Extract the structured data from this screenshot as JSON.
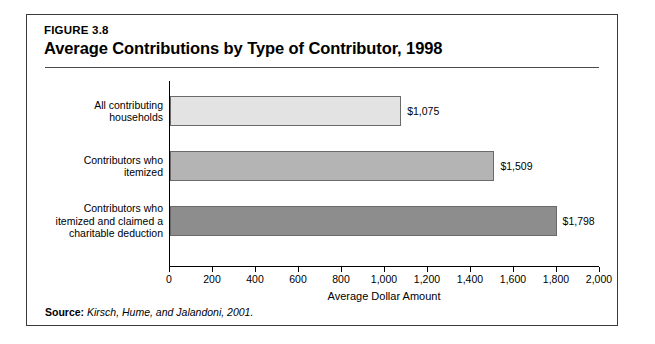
{
  "figure": {
    "number": "FIGURE 3.8",
    "title": "Average Contributions by Type of Contributor, 1998"
  },
  "source": {
    "label": "Source:",
    "text": "Kirsch, Hume, and Jalandoni, 2001."
  },
  "colors": {
    "bar_light": "#e3e3e3",
    "bar_medium": "#b4b4b4",
    "bar_dark": "#8d8d8d",
    "bar_border": "#6a6a6a",
    "axis": "#000000",
    "frame": "#3a3a3a"
  },
  "chart_data": {
    "type": "bar",
    "orientation": "horizontal",
    "title": "Average Contributions by Type of Contributor, 1998",
    "subtitle": "FIGURE 3.8",
    "xlabel": "Average Dollar Amount",
    "ylabel": "",
    "xlim": [
      0,
      2000
    ],
    "grid": false,
    "legend": "none",
    "xticks": [
      0,
      200,
      400,
      600,
      800,
      1000,
      1200,
      1400,
      1600,
      1800,
      2000
    ],
    "xtick_labels": [
      "0",
      "200",
      "400",
      "600",
      "800",
      "1,000",
      "1,200",
      "1,400",
      "1,600",
      "1,800",
      "2,000"
    ],
    "categories": [
      "All contributing households",
      "Contributors who itemized",
      "Contributors who itemized and claimed a charitable deduction"
    ],
    "values": [
      1075,
      1509,
      1798
    ],
    "data_labels": [
      "$1,075",
      "$1,509",
      "$1,798"
    ]
  },
  "bars": [
    {
      "label_lines": [
        "All contributing",
        "households"
      ],
      "value": 1075,
      "value_label": "$1,075",
      "color": "#e3e3e3"
    },
    {
      "label_lines": [
        "Contributors who",
        "itemized"
      ],
      "value": 1509,
      "value_label": "$1,509",
      "color": "#b4b4b4"
    },
    {
      "label_lines": [
        "Contributors who",
        "itemized and claimed a",
        "charitable deduction"
      ],
      "value": 1798,
      "value_label": "$1,798",
      "color": "#8d8d8d"
    }
  ]
}
